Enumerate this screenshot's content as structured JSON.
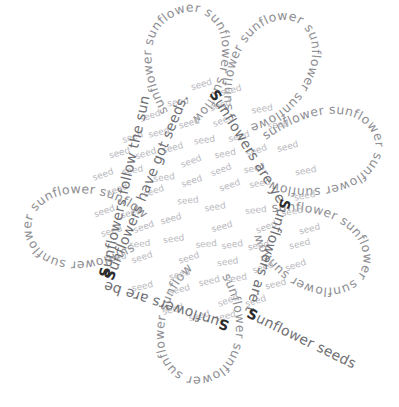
{
  "artwork": {
    "title": "Sunflower word art",
    "background_color": "#ffffff",
    "petal_word": "sunflower",
    "petal_word_color": "#8e8e93",
    "seed_word": "seed",
    "seed_word_color": "#b9b9be",
    "sentence_color": "#6f6f74",
    "capital_color": "#2b2b2b",
    "petal_count": 6,
    "seed_count": 120
  },
  "petals": [
    {
      "name": "petal-top-left",
      "label": "sunflower",
      "repeat": 7
    },
    {
      "name": "petal-top-right",
      "label": "sunflower",
      "repeat": 7
    },
    {
      "name": "petal-right-upper",
      "label": "sunflower",
      "repeat": 7
    },
    {
      "name": "petal-right-lower",
      "label": "sunflower",
      "repeat": 7
    },
    {
      "name": "petal-bottom",
      "label": "sunflower",
      "repeat": 7
    },
    {
      "name": "petal-left",
      "label": "sunflower",
      "repeat": 7
    }
  ],
  "sentences": [
    {
      "name": "sentence-seeds",
      "cap": "S",
      "rest": "unflowers have got seeds.",
      "full": "Sunflowers have got seeds."
    },
    {
      "name": "sentence-yellow",
      "cap": "S",
      "rest": "unflowers are yellow.",
      "full": "Sunflowers are yellow."
    },
    {
      "name": "sentence-tall",
      "cap": "S",
      "rest": "unflowers are tall.",
      "full": "Sunflowers are tall."
    },
    {
      "name": "sentence-delicious",
      "cap": "S",
      "rest": "unflower seeds are delicious.",
      "full": "Sunflower seeds are delicious."
    },
    {
      "name": "sentence-beautiful",
      "cap": "S",
      "rest": "unflowers are beautiful.",
      "full": "Sunflowers are beautiful."
    },
    {
      "name": "sentence-follow-sun",
      "cap": "S",
      "rest": "unflowers follow the sun.",
      "full": "Sunflowers follow the sun."
    }
  ]
}
